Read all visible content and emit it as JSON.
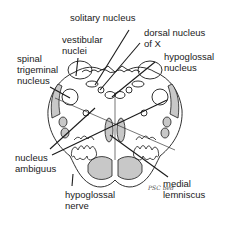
{
  "diagram": {
    "labels": {
      "solitary_nucleus": "solitary nucleus",
      "vestibular_nuclei_1": "vestibular",
      "vestibular_nuclei_2": "nuclei",
      "dorsal_nucleus_x_1": "dorsal nucleus",
      "dorsal_nucleus_x_2": "of X",
      "hypoglossal_nucleus_1": "hypoglossal",
      "hypoglossal_nucleus_2": "nucleus",
      "spinal_trigeminal_1": "spinal",
      "spinal_trigeminal_2": "trigeminal",
      "spinal_trigeminal_3": "nucleus",
      "nucleus_ambiguus_1": "nucleus",
      "nucleus_ambiguus_2": "ambiguus",
      "hypoglossal_nerve_1": "hypoglossal",
      "hypoglossal_nerve_2": "nerve",
      "medial_lemniscus_1": "medial",
      "medial_lemniscus_2": "lemniscus"
    },
    "signature": "PSC bed",
    "colors": {
      "line": "#1a1a1a",
      "shade": "#c8c8c8",
      "background": "#ffffff"
    }
  }
}
